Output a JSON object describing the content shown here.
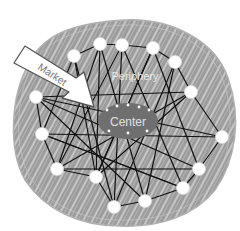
{
  "diagram": {
    "labels": {
      "center": "Center",
      "periphery": "Periphery",
      "market": "Market"
    },
    "colors": {
      "background": "#ffffff",
      "scribble_fill": "#9a9a9a",
      "scribble_stroke": "#b8b8b8",
      "scribble_highlight": "#e6e6e6",
      "center_fill": "#6f6f6f",
      "node_fill": "#ffffff",
      "edge": "#111111",
      "arrow_fill": "#ffffff",
      "arrow_stroke": "#555555",
      "label_light": "#e8e8e8",
      "label_dark": "#777777"
    },
    "nodes": [
      {
        "id": "n1",
        "x": 74,
        "y": 56
      },
      {
        "id": "n2",
        "x": 100,
        "y": 44
      },
      {
        "id": "n3",
        "x": 122,
        "y": 45
      },
      {
        "id": "n4",
        "x": 153,
        "y": 48
      },
      {
        "id": "n5",
        "x": 175,
        "y": 62
      },
      {
        "id": "n6",
        "x": 191,
        "y": 92
      },
      {
        "id": "n7",
        "x": 222,
        "y": 137
      },
      {
        "id": "n8",
        "x": 199,
        "y": 169
      },
      {
        "id": "n9",
        "x": 183,
        "y": 188
      },
      {
        "id": "n10",
        "x": 145,
        "y": 201
      },
      {
        "id": "n11",
        "x": 114,
        "y": 207
      },
      {
        "id": "n12",
        "x": 96,
        "y": 177
      },
      {
        "id": "n13",
        "x": 57,
        "y": 169
      },
      {
        "id": "n14",
        "x": 42,
        "y": 134
      },
      {
        "id": "n15",
        "x": 36,
        "y": 97
      }
    ],
    "edges": [
      [
        "n1",
        "n2"
      ],
      [
        "n2",
        "n3"
      ],
      [
        "n3",
        "n4"
      ],
      [
        "n4",
        "n5"
      ],
      [
        "n5",
        "n6"
      ],
      [
        "n6",
        "n7"
      ],
      [
        "n7",
        "n8"
      ],
      [
        "n8",
        "n9"
      ],
      [
        "n9",
        "n10"
      ],
      [
        "n10",
        "n11"
      ],
      [
        "n11",
        "n12"
      ],
      [
        "n12",
        "n13"
      ],
      [
        "n13",
        "n14"
      ],
      [
        "n14",
        "n15"
      ],
      [
        "n1",
        "n14"
      ],
      [
        "n1",
        "n12"
      ],
      [
        "n2",
        "n13"
      ],
      [
        "n2",
        "n10"
      ],
      [
        "n3",
        "n11"
      ],
      [
        "n3",
        "n9"
      ],
      [
        "n4",
        "n12"
      ],
      [
        "n4",
        "n8"
      ],
      [
        "n5",
        "n11"
      ],
      [
        "n5",
        "n10"
      ],
      [
        "n6",
        "n13"
      ],
      [
        "n6",
        "n12"
      ],
      [
        "n7",
        "n14"
      ],
      [
        "n7",
        "n15"
      ],
      [
        "n8",
        "n15"
      ],
      [
        "n9",
        "n14"
      ],
      [
        "n10",
        "n15"
      ],
      [
        "n11",
        "n1"
      ],
      [
        "n15",
        "n6"
      ],
      [
        "n13",
        "n8"
      ],
      [
        "n14",
        "n9"
      ],
      [
        "n12",
        "n4"
      ],
      [
        "n2",
        "n12"
      ],
      [
        "n3",
        "n13"
      ]
    ],
    "center": {
      "cx": 128,
      "cy": 121,
      "rx": 30,
      "ry": 18
    },
    "center_dots": [
      {
        "x": 107,
        "y": 110
      },
      {
        "x": 117,
        "y": 106
      },
      {
        "x": 128,
        "y": 105
      },
      {
        "x": 139,
        "y": 107
      },
      {
        "x": 149,
        "y": 110
      },
      {
        "x": 109,
        "y": 131
      },
      {
        "x": 128,
        "y": 133
      },
      {
        "x": 147,
        "y": 131
      }
    ]
  }
}
